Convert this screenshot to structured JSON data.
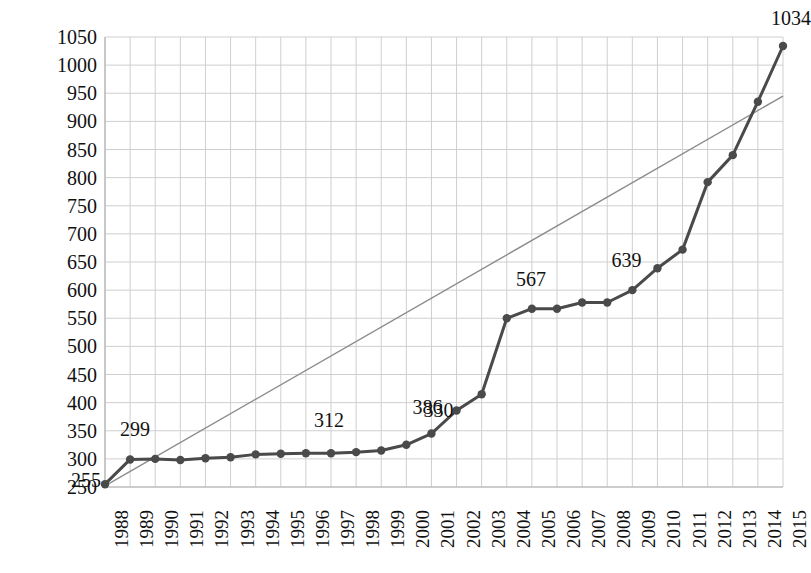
{
  "chart_data": {
    "type": "line",
    "title": "",
    "subtitle": "",
    "xlabel": "",
    "ylabel": "",
    "grid": true,
    "legend": "none",
    "xlim": [
      1988,
      2015
    ],
    "ylim": [
      250,
      1050
    ],
    "ytick_step": 50,
    "categories": [
      "1988",
      "1989",
      "1990",
      "1991",
      "1992",
      "1993",
      "1994",
      "1995",
      "1996",
      "1997",
      "1998",
      "1999",
      "2000",
      "2001",
      "2002",
      "2003",
      "2004",
      "2005",
      "2006",
      "2007",
      "2008",
      "2009",
      "2010",
      "2011",
      "2012",
      "2013",
      "2014",
      "2015"
    ],
    "yticks": [
      "250",
      "300",
      "350",
      "400",
      "450",
      "500",
      "550",
      "600",
      "650",
      "700",
      "750",
      "800",
      "850",
      "900",
      "950",
      "1000",
      "1050"
    ],
    "series": [
      {
        "name": "data",
        "kind": "line-marker",
        "color": "#4a4a4a",
        "values": [
          255,
          299,
          300,
          298,
          301,
          303,
          308,
          309,
          310,
          310,
          312,
          315,
          325,
          345,
          386,
          415,
          550,
          567,
          567,
          578,
          578,
          600,
          639,
          672,
          792,
          840,
          935,
          1034
        ]
      },
      {
        "name": "trendline",
        "kind": "line",
        "color": "#8c8c8c",
        "endpoints": [
          {
            "x": 1988,
            "y": 252
          },
          {
            "x": 2015,
            "y": 945
          }
        ]
      }
    ],
    "point_labels": [
      {
        "category": "1988",
        "value": 255,
        "text": "255"
      },
      {
        "category": "1989",
        "value": 299,
        "text": "299"
      },
      {
        "category": "1998",
        "value": 312,
        "text": "312"
      },
      {
        "category": "2001",
        "value": 330,
        "text": "330"
      },
      {
        "category": "2002",
        "value": 386,
        "text": "386"
      },
      {
        "category": "2005",
        "value": 567,
        "text": "567"
      },
      {
        "category": "2010",
        "value": 639,
        "text": "639"
      },
      {
        "category": "2015",
        "value": 1034,
        "text": "1034"
      }
    ],
    "colors": {
      "series_line": "#4a4a4a",
      "trend_line": "#8c8c8c",
      "gridline": "#cfcfcf",
      "axis": "#b4b4b4",
      "text": "#111111",
      "background": "#ffffff"
    }
  }
}
